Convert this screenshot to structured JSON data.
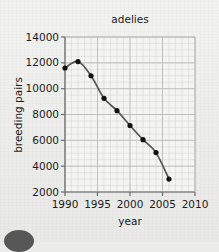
{
  "page": {
    "background_color": "#eeeeed",
    "corner_mark": "dark-semicircle"
  },
  "chart_data": {
    "type": "line",
    "title": "adelies",
    "xlabel": "year",
    "ylabel": "breeding pairs",
    "x": [
      1990,
      1992,
      1994,
      1996,
      1998,
      2000,
      2002,
      2004,
      2006
    ],
    "values": [
      11600,
      12100,
      11000,
      9250,
      8300,
      7150,
      6050,
      5050,
      3000
    ],
    "series": [
      {
        "name": "breeding pairs",
        "values": [
          11600,
          12100,
          11000,
          9250,
          8300,
          7150,
          6050,
          5050,
          3000
        ]
      }
    ],
    "xlim": [
      1990,
      2010
    ],
    "ylim": [
      2000,
      14000
    ],
    "xticks": [
      1990,
      1995,
      2000,
      2005,
      2010
    ],
    "yticks": [
      2000,
      4000,
      6000,
      8000,
      10000,
      12000,
      14000
    ],
    "xtick_labels": [
      "1990",
      "1995",
      "2000",
      "2005",
      "2010"
    ],
    "ytick_labels": [
      "2000",
      "4000",
      "6000",
      "8000",
      "10000",
      "12000",
      "14000"
    ],
    "x_minor_step": 1,
    "y_minor_step": 500,
    "grid": true,
    "grid_minor": true,
    "legend": "none",
    "marker": "filled-circle",
    "line_color": "#555555",
    "marker_color": "#111111",
    "grid_color": "#b9b9b9",
    "grid_minor_color": "#d2d2d2",
    "axis_color": "#6a6a6a"
  }
}
